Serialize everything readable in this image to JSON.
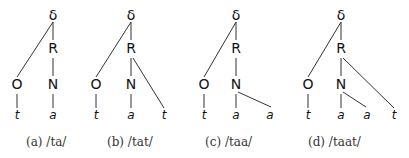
{
  "figure": {
    "subfigures": [
      {
        "id": "a",
        "caption": "(a) /ta/",
        "caption_x": 26,
        "nodes": [
          {
            "label": "δ",
            "x": 53,
            "y": 20,
            "type": "node"
          },
          {
            "label": "R",
            "x": 53,
            "y": 53,
            "type": "node"
          },
          {
            "label": "O",
            "x": 17,
            "y": 89,
            "type": "node"
          },
          {
            "label": "N",
            "x": 53,
            "y": 89,
            "type": "node"
          },
          {
            "label": "t",
            "x": 17,
            "y": 119,
            "type": "leaf"
          },
          {
            "label": "a",
            "x": 53,
            "y": 119,
            "type": "leaf"
          }
        ],
        "edges": [
          [
            53,
            22,
            17,
            77
          ],
          [
            53,
            22,
            53,
            40
          ],
          [
            53,
            58,
            53,
            76
          ],
          [
            17,
            94,
            17,
            108
          ],
          [
            53,
            94,
            53,
            108
          ]
        ]
      },
      {
        "id": "b",
        "caption": "(b) /tat/",
        "caption_x": 107,
        "nodes": [
          {
            "label": "δ",
            "x": 131,
            "y": 20,
            "type": "node"
          },
          {
            "label": "R",
            "x": 131,
            "y": 53,
            "type": "node"
          },
          {
            "label": "O",
            "x": 96,
            "y": 89,
            "type": "node"
          },
          {
            "label": "N",
            "x": 131,
            "y": 89,
            "type": "node"
          },
          {
            "label": "t",
            "x": 96,
            "y": 119,
            "type": "leaf"
          },
          {
            "label": "a",
            "x": 131,
            "y": 119,
            "type": "leaf"
          },
          {
            "label": "t",
            "x": 164,
            "y": 119,
            "type": "leaf"
          }
        ],
        "edges": [
          [
            131,
            22,
            96,
            77
          ],
          [
            131,
            22,
            131,
            40
          ],
          [
            131,
            58,
            131,
            76
          ],
          [
            96,
            94,
            96,
            108
          ],
          [
            131,
            94,
            131,
            108
          ],
          [
            133,
            58,
            164,
            108
          ]
        ]
      },
      {
        "id": "c",
        "caption": "(c) /taa/",
        "caption_x": 205,
        "nodes": [
          {
            "label": "δ",
            "x": 236,
            "y": 20,
            "type": "node"
          },
          {
            "label": "R",
            "x": 236,
            "y": 53,
            "type": "node"
          },
          {
            "label": "O",
            "x": 204,
            "y": 89,
            "type": "node"
          },
          {
            "label": "N",
            "x": 236,
            "y": 89,
            "type": "node"
          },
          {
            "label": "t",
            "x": 204,
            "y": 119,
            "type": "leaf"
          },
          {
            "label": "a",
            "x": 236,
            "y": 119,
            "type": "leaf"
          },
          {
            "label": "a",
            "x": 270,
            "y": 119,
            "type": "leaf"
          }
        ],
        "edges": [
          [
            236,
            22,
            204,
            77
          ],
          [
            236,
            22,
            236,
            40
          ],
          [
            236,
            58,
            236,
            76
          ],
          [
            204,
            94,
            204,
            108
          ],
          [
            236,
            94,
            236,
            108
          ],
          [
            238,
            92,
            271,
            107
          ]
        ]
      },
      {
        "id": "d",
        "caption": "(d) /taat/",
        "caption_x": 308,
        "nodes": [
          {
            "label": "δ",
            "x": 341,
            "y": 20,
            "type": "node"
          },
          {
            "label": "R",
            "x": 341,
            "y": 53,
            "type": "node"
          },
          {
            "label": "O",
            "x": 308,
            "y": 89,
            "type": "node"
          },
          {
            "label": "N",
            "x": 341,
            "y": 89,
            "type": "node"
          },
          {
            "label": "t",
            "x": 308,
            "y": 119,
            "type": "leaf"
          },
          {
            "label": "a",
            "x": 341,
            "y": 119,
            "type": "leaf"
          },
          {
            "label": "a",
            "x": 367,
            "y": 119,
            "type": "leaf"
          },
          {
            "label": "t",
            "x": 394,
            "y": 119,
            "type": "leaf"
          }
        ],
        "edges": [
          [
            341,
            22,
            308,
            77
          ],
          [
            341,
            22,
            341,
            40
          ],
          [
            341,
            58,
            341,
            76
          ],
          [
            308,
            94,
            308,
            108
          ],
          [
            341,
            94,
            341,
            108
          ],
          [
            343,
            92,
            366,
            107
          ],
          [
            343,
            58,
            394,
            108
          ]
        ]
      }
    ]
  }
}
